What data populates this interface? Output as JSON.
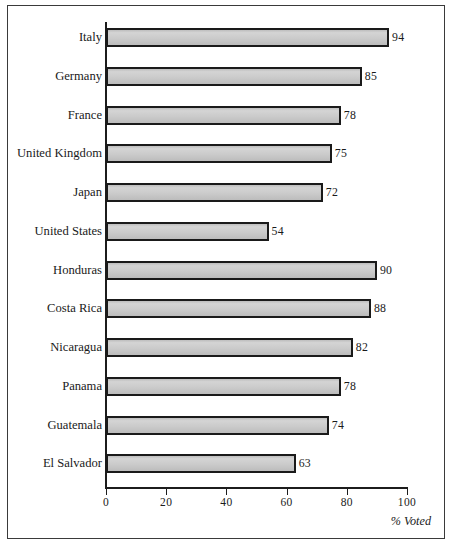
{
  "chart_data": {
    "type": "bar",
    "orientation": "horizontal",
    "title": "",
    "subtitle": "",
    "xlabel": "% Voted",
    "ylabel": "",
    "xlim": [
      0,
      100
    ],
    "grid": false,
    "legend": null,
    "categories": [
      "Italy",
      "Germany",
      "France",
      "United Kingdom",
      "Japan",
      "United States",
      "Honduras",
      "Costa Rica",
      "Nicaragua",
      "Panama",
      "Guatemala",
      "El Salvador"
    ],
    "values": [
      94,
      85,
      78,
      75,
      72,
      54,
      90,
      88,
      82,
      78,
      74,
      63
    ],
    "value_labels": [
      "94",
      "85",
      "78",
      "75",
      "72",
      "54",
      "90",
      "88",
      "82",
      "78",
      "74",
      "63"
    ],
    "xticks": [
      0,
      20,
      40,
      60,
      80,
      100
    ],
    "xtick_labels": [
      "0",
      "20",
      "40",
      "60",
      "80",
      "100"
    ],
    "bar_fill_color": "#c9c9c9",
    "bar_edge_color": "#1a1a1a",
    "axis_color": "#1c1c1c",
    "background_color": "#ffffff",
    "frame_color": "#3a3a3a"
  }
}
